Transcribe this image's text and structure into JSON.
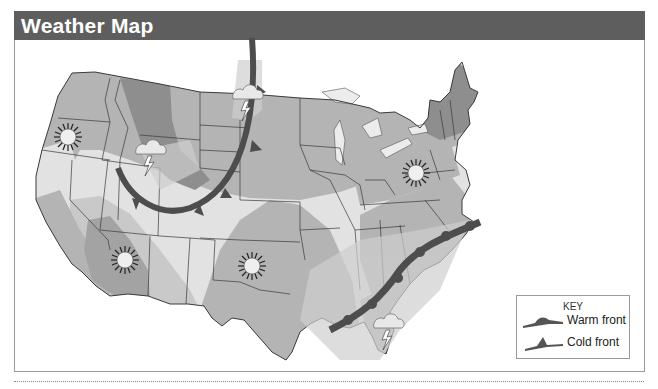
{
  "title": "Weather Map",
  "colors": {
    "header_bg": "#5e5e5e",
    "header_text": "#ffffff",
    "zone_light": "#e2e2e2",
    "zone_medium": "#b4b4b4",
    "zone_dark": "#8e8e8e",
    "zone_darkest": "#707070",
    "front": "#555555",
    "border_lines": "#3a3a3a"
  },
  "key": {
    "title": "KEY",
    "items": [
      {
        "label": "Warm front",
        "symbol": "warm-front-icon"
      },
      {
        "label": "Cold front",
        "symbol": "cold-front-icon"
      }
    ]
  },
  "map": {
    "region": "Contiguous United States",
    "fronts": [
      {
        "type": "cold front",
        "location": "Northern Plains arc from North Dakota through Wyoming/Colorado to Idaho"
      },
      {
        "type": "warm front",
        "location": "Gulf & Southeast coast from Louisiana to the Carolinas"
      }
    ],
    "weather_symbols": [
      {
        "type": "sunny",
        "location": "Oregon / Northern California",
        "icon": "sun-icon"
      },
      {
        "type": "thunderstorm",
        "location": "Idaho / Wyoming",
        "icon": "thunderstorm-icon"
      },
      {
        "type": "thunderstorm",
        "location": "North Dakota",
        "icon": "thunderstorm-icon"
      },
      {
        "type": "sunny",
        "location": "Arizona",
        "icon": "sun-icon"
      },
      {
        "type": "sunny",
        "location": "Texas Panhandle",
        "icon": "sun-icon"
      },
      {
        "type": "sunny",
        "location": "Pennsylvania / West Virginia",
        "icon": "sun-icon"
      },
      {
        "type": "thunderstorm",
        "location": "Gulf of Mexico off Florida",
        "icon": "thunderstorm-icon"
      }
    ]
  }
}
